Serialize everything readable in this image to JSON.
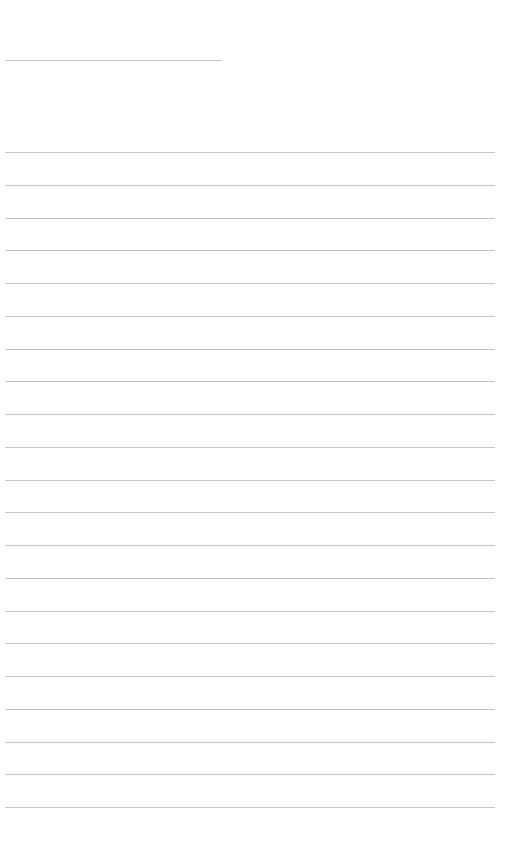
{
  "page": {
    "type": "lined-notebook-page",
    "background_color": "#ffffff",
    "line_color": "#c4c4c4",
    "title_line": {
      "x": 5,
      "y": 60,
      "width": 217,
      "text": ""
    },
    "writing_lines": {
      "count": 21,
      "x": 5,
      "width": 490,
      "first_y": 152,
      "spacing": 32.75,
      "texts": [
        "",
        "",
        "",
        "",
        "",
        "",
        "",
        "",
        "",
        "",
        "",
        "",
        "",
        "",
        "",
        "",
        "",
        "",
        "",
        "",
        ""
      ]
    }
  }
}
